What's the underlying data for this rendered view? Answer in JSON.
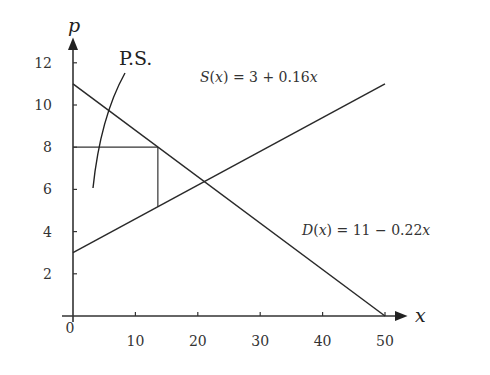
{
  "chart_data": {
    "type": "line",
    "title": "",
    "xlabel": "x",
    "ylabel": "p",
    "xlim": [
      0,
      50
    ],
    "ylim": [
      0,
      12
    ],
    "grid": false,
    "x_ticks": [
      0,
      10,
      20,
      30,
      40,
      50
    ],
    "x_tick_labels": [
      "0",
      "10",
      "20",
      "30",
      "40",
      "50"
    ],
    "y_ticks": [
      2,
      4,
      6,
      8,
      10,
      12
    ],
    "y_tick_labels": [
      "2",
      "4",
      "6",
      "8",
      "10",
      "12"
    ],
    "series": [
      {
        "name": "S(x) = 3 + 0.16x",
        "label_parts": {
          "fn": "S",
          "arg": "x",
          "rhs": "= 3 + 0.16",
          "var": "x"
        },
        "x": [
          0,
          50
        ],
        "y": [
          3,
          11
        ]
      },
      {
        "name": "D(x) = 11 - 0.22x",
        "label_parts": {
          "fn": "D",
          "arg": "x",
          "rhs": "= 11 − 0.22",
          "var": "x"
        },
        "x": [
          0,
          50
        ],
        "y": [
          11,
          0
        ]
      }
    ],
    "annotations": [
      {
        "text": "P.S.",
        "type": "curved-pointer",
        "points_to": "region below p=8 above supply curve"
      },
      {
        "type": "rectangle-guide",
        "price_level": 8,
        "x_at_demand": 13.6,
        "supply_at_x": 5.18
      }
    ],
    "equilibrium": {
      "x": 21.05,
      "p": 6.37
    }
  },
  "labels": {
    "p_axis": "p",
    "x_axis": "x",
    "ps": "P.S.",
    "origin": "0"
  }
}
